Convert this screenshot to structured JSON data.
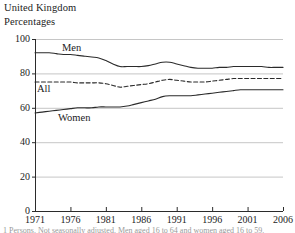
{
  "header": {
    "country": "United Kingdom",
    "units": "Percentages"
  },
  "footnote": {
    "text": "1 Persons. Not seasonally adjusted. Men aged 16 to 64 and women aged 16 to 59."
  },
  "axes": {
    "y_ticks": [
      "0",
      "20",
      "40",
      "60",
      "80",
      "100"
    ],
    "x_ticks": [
      "1971",
      "1976",
      "1981",
      "1986",
      "1991",
      "1996",
      "2001",
      "2006"
    ]
  },
  "series_labels": {
    "men": "Men",
    "all": "All",
    "women": "Women"
  },
  "colors": {
    "line": "#2b2b2b",
    "grid": "#b8b8b8",
    "axis": "#2b2b2b",
    "text": "#1c1c1c"
  },
  "chart_data": {
    "type": "line",
    "title": "",
    "subtitle": "",
    "xlabel": "",
    "ylabel": "Percentages",
    "xlim": [
      1971,
      2006
    ],
    "ylim": [
      0,
      100
    ],
    "y_ticks": [
      0,
      20,
      40,
      60,
      80,
      100
    ],
    "x_ticks": [
      1971,
      1976,
      1981,
      1986,
      1991,
      1996,
      2001,
      2006
    ],
    "grid": true,
    "legend": "inline-labels",
    "x": [
      1971,
      1972,
      1973,
      1974,
      1975,
      1976,
      1977,
      1978,
      1979,
      1980,
      1981,
      1982,
      1983,
      1984,
      1985,
      1986,
      1987,
      1988,
      1989,
      1990,
      1991,
      1992,
      1993,
      1994,
      1995,
      1996,
      1997,
      1998,
      1999,
      2000,
      2001,
      2002,
      2003,
      2004,
      2005,
      2006
    ],
    "series": [
      {
        "name": "Men",
        "style": "solid",
        "values": [
          92,
          92,
          92,
          91.5,
          91,
          91,
          90.5,
          90,
          89.5,
          89,
          87.5,
          85.5,
          84,
          84,
          84,
          84,
          84.5,
          85.5,
          86.5,
          86.5,
          85.5,
          84.5,
          83.5,
          83,
          83,
          83,
          83.5,
          83.5,
          84,
          84,
          84,
          84,
          84,
          83.5,
          83.5,
          83.5
        ],
        "end_value": 83.5
      },
      {
        "name": "All",
        "style": "dashed",
        "values": [
          75,
          75,
          75,
          75,
          75,
          75,
          74.5,
          74.5,
          74.5,
          74.5,
          74,
          73,
          72,
          72.5,
          73,
          73.5,
          74,
          75,
          76,
          76.5,
          76,
          75.5,
          75,
          75,
          75,
          75.5,
          76,
          76.5,
          77,
          77,
          77,
          77,
          77,
          77,
          77,
          77
        ],
        "end_value": 77
      },
      {
        "name": "Women",
        "style": "solid",
        "values": [
          57,
          57.5,
          58,
          58.5,
          59,
          59.5,
          60,
          60,
          60,
          60.5,
          60.5,
          60.5,
          60.5,
          61,
          62,
          63,
          64,
          65,
          66.5,
          67,
          67,
          67,
          67,
          67.5,
          68,
          68.5,
          69,
          69.5,
          70,
          70.5,
          70.5,
          70.5,
          70.5,
          70.5,
          70.5,
          70.5
        ],
        "end_value": 70.5
      }
    ]
  }
}
